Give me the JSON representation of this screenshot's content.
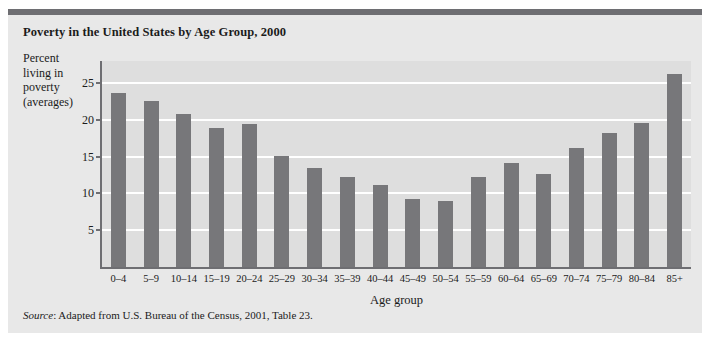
{
  "figure": {
    "title": "Poverty in the United States by Age Group, 2000",
    "source_word": "Source",
    "source_text": ": Adapted from U.S. Bureau of the Census, 2001, Table 23."
  },
  "colors": {
    "bar": "#77777a",
    "plot_background": "#dedede",
    "panel_background": "#e8e8e8",
    "axis": "#6e6e72",
    "gridline": "#ffffff",
    "text": "#1b1b1b"
  },
  "ylabel_lines": [
    "Percent",
    "living in",
    "poverty",
    "(averages)"
  ],
  "chart_data": {
    "type": "bar",
    "title": "Poverty in the United States by Age Group, 2000",
    "xlabel": "Age group",
    "ylabel": "Percent living in poverty (averages)",
    "categories": [
      "0–4",
      "5–9",
      "10–14",
      "15–19",
      "20–24",
      "25–29",
      "30–34",
      "35–39",
      "40–44",
      "45–49",
      "50–54",
      "55–59",
      "60–64",
      "65–69",
      "70–74",
      "75–79",
      "80–84",
      "85+"
    ],
    "values": [
      23.7,
      22.5,
      20.8,
      18.9,
      19.5,
      15.1,
      13.5,
      12.2,
      11.2,
      9.2,
      9.0,
      12.3,
      14.2,
      12.7,
      16.2,
      18.2,
      19.6,
      26.2
    ],
    "yticks": [
      5,
      10,
      15,
      20,
      25
    ],
    "ylim": [
      0,
      28
    ],
    "grid": true,
    "legend": null
  }
}
